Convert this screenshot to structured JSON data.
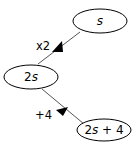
{
  "diagram": {
    "nodes": [
      {
        "id": "n1",
        "label_var": "s",
        "label_prefix": "",
        "label_suffix": ""
      },
      {
        "id": "n2",
        "label_prefix": "2",
        "label_var": "s",
        "label_suffix": ""
      },
      {
        "id": "n3",
        "label_prefix": "2",
        "label_var": "s",
        "label_suffix": " + 4"
      }
    ],
    "edges": [
      {
        "from": "n1",
        "to": "n2",
        "label": "x2"
      },
      {
        "from": "n2",
        "to": "n3",
        "label": "+4"
      }
    ],
    "colors": {
      "stroke": "#000000",
      "line": "#555555",
      "background": "#ffffff"
    }
  }
}
